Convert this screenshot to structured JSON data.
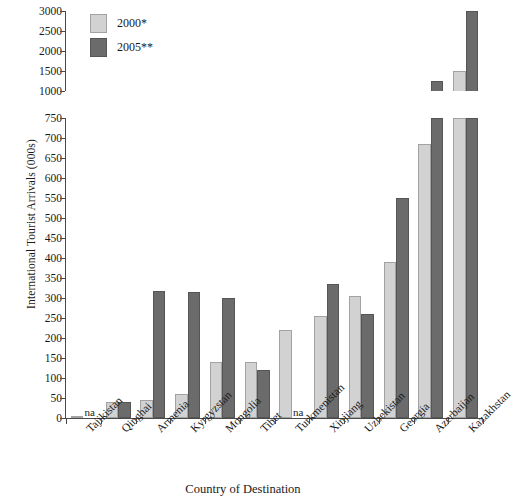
{
  "chart_data": {
    "type": "bar",
    "title": "",
    "xlabel": "Country of Destination",
    "ylabel": "International Tourist Arrivals (000s)",
    "categories": [
      "Tajikistan",
      "Qinghai",
      "Armenia",
      "Kyrgyzstan",
      "Mongolia",
      "Tibet",
      "Turkmenistan",
      "Xinjiang",
      "Uzbekistan",
      "Georgia",
      "Azerbaijan",
      "Kazakhstan"
    ],
    "series": [
      {
        "name": "2000*",
        "color": "#d2d2d2",
        "values": [
          5,
          40,
          45,
          60,
          140,
          140,
          220,
          255,
          305,
          390,
          685,
          1500
        ]
      },
      {
        "name": "2005**",
        "color": "#6b6b6b",
        "values": [
          null,
          40,
          318,
          315,
          300,
          120,
          null,
          335,
          260,
          550,
          1250,
          3050
        ]
      }
    ],
    "missing_label": "na",
    "missing_points": [
      {
        "category": "Tajikistan",
        "series": "2005**"
      },
      {
        "category": "Turkmenistan",
        "series": "2005**"
      }
    ],
    "axis_break": true,
    "lower_axis": {
      "ylim": [
        0,
        750
      ],
      "ticks": [
        0,
        50,
        100,
        150,
        200,
        250,
        300,
        350,
        400,
        450,
        500,
        550,
        600,
        650,
        700,
        750
      ]
    },
    "upper_axis": {
      "ylim": [
        1000,
        3000
      ],
      "ticks": [
        1000,
        1500,
        2000,
        2500,
        3000
      ]
    },
    "grid": false,
    "legend_position": "top-left"
  }
}
